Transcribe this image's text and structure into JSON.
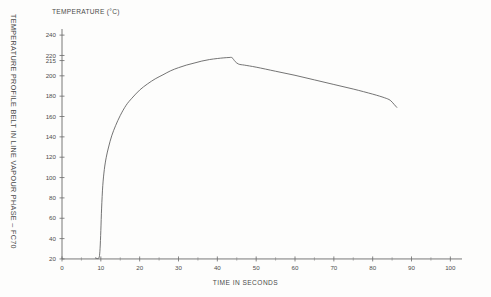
{
  "chart_data": {
    "type": "line",
    "title": "TEMPERATURE PROFILE BELT IN LINE VAPOUR PHASE – FC70",
    "xlabel": "TIME IN SECONDS",
    "ylabel": "TEMPERATURE (°C)",
    "xlim": [
      0,
      103
    ],
    "ylim": [
      17,
      247
    ],
    "grid": false,
    "legend": null,
    "x_major_ticks": [
      0,
      10,
      20,
      30,
      40,
      50,
      60,
      70,
      80,
      90,
      100
    ],
    "x_tick_labels": [
      "0",
      "10",
      "20",
      "30",
      "40",
      "50",
      "60",
      "70",
      "80",
      "90",
      "100"
    ],
    "x_minor_ticks": [
      5,
      15,
      25,
      35,
      45,
      55,
      65,
      75,
      85,
      95
    ],
    "y_major_ticks": [
      20,
      40,
      60,
      80,
      100,
      120,
      140,
      160,
      180,
      200,
      215,
      220,
      240
    ],
    "y_tick_labels": [
      "20",
      "40",
      "60",
      "80",
      "100",
      "120",
      "140",
      "160",
      "180",
      "200",
      "215",
      "220",
      "240"
    ],
    "series": [
      {
        "name": "Belt in line vapour phase FC70",
        "color": "#5b5b5b",
        "x": [
          8.6,
          9.0,
          9.3,
          9.6,
          9.8,
          10.0,
          10.2,
          10.5,
          10.9,
          11.4,
          12.0,
          12.8,
          13.8,
          15.0,
          16.5,
          18.0,
          20.0,
          22.0,
          24.0,
          26.0,
          28.0,
          30.0,
          32.0,
          34.0,
          36.0,
          38.0,
          40.0,
          41.5,
          43.0,
          43.8,
          44.6,
          45.5,
          47.0,
          50.0,
          55.0,
          60.0,
          65.0,
          70.0,
          75.0,
          80.0,
          83.0,
          84.5,
          85.5,
          86.2
        ],
        "y": [
          21,
          20.5,
          20.5,
          22,
          30,
          48,
          70,
          92,
          108,
          120,
          130,
          141,
          151,
          161,
          171,
          178,
          186,
          192,
          197,
          201,
          205,
          208,
          210.5,
          212.5,
          214.5,
          216,
          217,
          217.6,
          218,
          217.8,
          214,
          211.5,
          210.5,
          208.5,
          204.5,
          200.5,
          196,
          191.5,
          187,
          182,
          178.5,
          176,
          172,
          169
        ]
      }
    ],
    "annotations": []
  }
}
